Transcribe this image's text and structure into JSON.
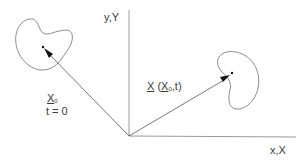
{
  "diagram": {
    "type": "kinematics-position-vectors",
    "axes": {
      "y_label": "y,Y",
      "x_label": "x,X",
      "color": "#9a9a9a"
    },
    "initial": {
      "vector_symbol": "X",
      "vector_subscript": "0",
      "time_label": "t = 0"
    },
    "current": {
      "vector_symbol": "X",
      "arg_open": " (",
      "arg_symbol": "X",
      "arg_subscript": "0",
      "arg_rest": ",t)"
    },
    "colors": {
      "line": "#555555",
      "blob": "#707070",
      "text": "#3a3a3a",
      "arrowhead": "#111111"
    }
  }
}
